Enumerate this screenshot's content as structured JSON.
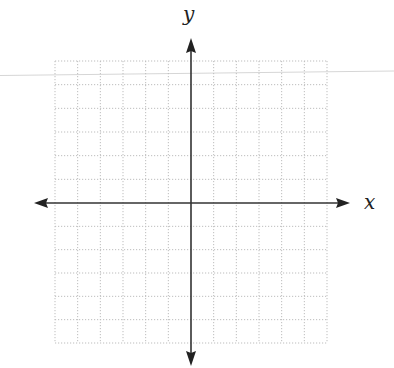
{
  "diagram": {
    "type": "coordinate-plane",
    "x_axis_label": "x",
    "y_axis_label": "y",
    "grid": {
      "columns_left_of_origin": 6,
      "columns_right_of_origin": 6,
      "rows_above_origin": 6,
      "rows_below_origin": 6,
      "line_style": "dotted",
      "line_color": "#bdbdbd"
    },
    "axes": {
      "color": "#333333",
      "arrows": [
        "left",
        "right",
        "up",
        "down"
      ]
    },
    "scan_artifact_line_color": "#d6d6d6"
  }
}
